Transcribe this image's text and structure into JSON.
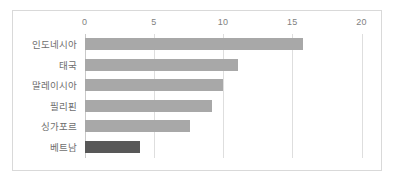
{
  "chart_data": {
    "type": "bar",
    "orientation": "horizontal",
    "title": "",
    "subtitle": "",
    "xlabel": "",
    "ylabel": "",
    "categories": [
      "인도네시아",
      "태국",
      "말레이시아",
      "필리핀",
      "싱가포르",
      "베트남"
    ],
    "values": [
      15.8,
      11.1,
      10.0,
      9.2,
      7.6,
      4.0
    ],
    "series": [
      {
        "name": "",
        "values": [
          15.8,
          11.1,
          10.0,
          9.2,
          7.6,
          4.0
        ]
      }
    ],
    "xlim": [
      0,
      20
    ],
    "xticks": [
      0,
      5,
      10,
      15,
      20
    ],
    "xtick_labels": [
      "0",
      "5",
      "10",
      "15",
      "20"
    ],
    "grid": "vertical-only",
    "legend": "none",
    "highlight_category": "베트남",
    "colors": {
      "bar": "#a8a8a8",
      "bar_highlight": "#585858",
      "gridline": "#dedede",
      "axis": "#c9c9c9",
      "tick_text": "#7f7f7f",
      "category_text": "#6e6e6e",
      "frame_border": "#d9d9d9",
      "background": "#ffffff"
    }
  }
}
